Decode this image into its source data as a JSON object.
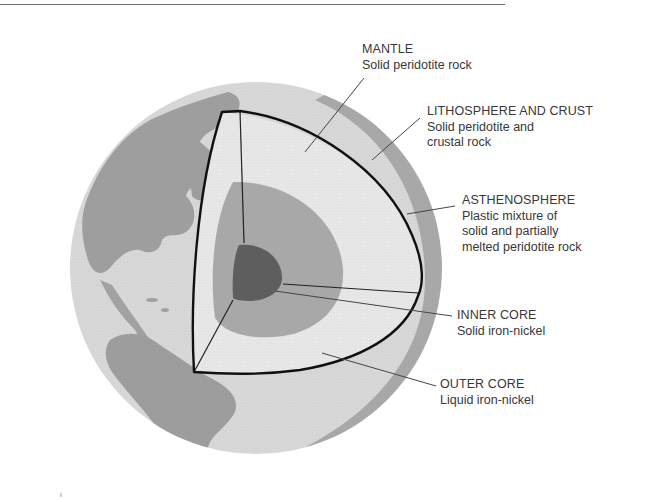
{
  "figure": {
    "colors": {
      "ocean": "#d6d6d6",
      "land": "#9e9e9e",
      "crust_rim": "#a8a8a8",
      "mantle": "#e6e6e6",
      "outer_core": "#a6a6a6",
      "inner_core": "#5e5e5e",
      "outline": "#111111",
      "leader": "#444444"
    }
  },
  "labels": {
    "mantle": {
      "title": "MANTLE",
      "desc": [
        "Solid peridotite rock"
      ]
    },
    "lithosphere": {
      "title": "LITHOSPHERE AND CRUST",
      "desc": [
        "Solid peridotite and",
        "crustal rock"
      ]
    },
    "asthenosphere": {
      "title": "ASTHENOSPHERE",
      "desc": [
        "Plastic mixture of",
        "solid and partially",
        "melted peridotite rock"
      ]
    },
    "inner_core": {
      "title": "INNER CORE",
      "desc": [
        "Solid iron-nickel"
      ]
    },
    "outer_core": {
      "title": "OUTER CORE",
      "desc": [
        "Liquid iron-nickel"
      ]
    }
  }
}
